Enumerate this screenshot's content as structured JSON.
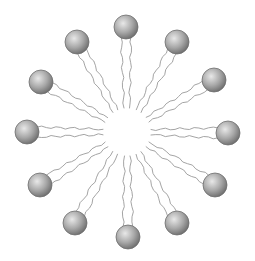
{
  "diagram": {
    "type": "micelle",
    "canvas": {
      "width": 255,
      "height": 261,
      "background": "#ffffff"
    },
    "center": {
      "x": 127,
      "y": 132
    },
    "core_radius": 24,
    "head_radius": 12,
    "tail_spacing": 10,
    "colors": {
      "head_highlight": "#e8e8e8",
      "head_mid": "#a8a8a8",
      "head_shadow": "#6a6a6a",
      "head_outline": "#6e6e6e",
      "tail": "#9a9a9a"
    },
    "molecules": [
      {
        "id": "top",
        "head": {
          "x": 126,
          "y": 27
        }
      },
      {
        "id": "top-right",
        "head": {
          "x": 177,
          "y": 42
        }
      },
      {
        "id": "right-upper",
        "head": {
          "x": 214,
          "y": 80
        }
      },
      {
        "id": "right",
        "head": {
          "x": 228,
          "y": 133
        }
      },
      {
        "id": "right-lower",
        "head": {
          "x": 215,
          "y": 185
        }
      },
      {
        "id": "bottom-right",
        "head": {
          "x": 177,
          "y": 223
        }
      },
      {
        "id": "bottom",
        "head": {
          "x": 128,
          "y": 237
        }
      },
      {
        "id": "bottom-left",
        "head": {
          "x": 75,
          "y": 223
        }
      },
      {
        "id": "left-lower",
        "head": {
          "x": 40,
          "y": 185
        }
      },
      {
        "id": "left",
        "head": {
          "x": 27,
          "y": 132
        }
      },
      {
        "id": "left-upper",
        "head": {
          "x": 41,
          "y": 82
        }
      },
      {
        "id": "top-left",
        "head": {
          "x": 77,
          "y": 42
        }
      }
    ]
  }
}
